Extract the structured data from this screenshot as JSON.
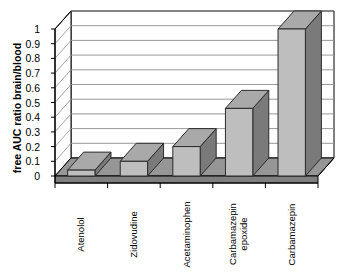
{
  "chart_data": {
    "type": "bar",
    "title": "",
    "subtitle": "",
    "xlabel": "",
    "ylabel": "free AUC ratio brain/blood",
    "categories": [
      "Atenolol",
      "Zidovudine",
      "Acetaminophen",
      "Carbamazepin epoxide",
      "Carbamazepin"
    ],
    "values": [
      0.04,
      0.1,
      0.2,
      0.46,
      1.0
    ],
    "ylim": [
      0,
      1
    ],
    "yticks": [
      "0",
      "0.1",
      "0.2",
      "0.3",
      "0.4",
      "0.5",
      "0.6",
      "0.7",
      "0.8",
      "0.9",
      "1"
    ],
    "ytick_values": [
      0,
      0.1,
      0.2,
      0.3,
      0.4,
      0.5,
      0.6,
      0.7,
      0.8,
      0.9,
      1
    ],
    "grid": true,
    "legend": null,
    "style": "3d-column",
    "colors": {
      "bar_face": "#bebebe",
      "bar_side": "#7a7a7a",
      "bar_top": "#a9a9a9",
      "floor": "#969696",
      "floor_side": "#808080",
      "gridline": "#8c8c8c",
      "axis": "#000000",
      "background": "#ffffff"
    }
  },
  "axis": {
    "y_title": "free AUC ratio brain/blood"
  }
}
